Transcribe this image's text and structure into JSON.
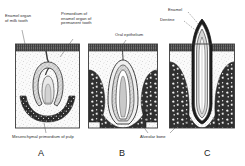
{
  "figure": {
    "background_color": "#ffffff",
    "ink_color": "#2b2b2b"
  },
  "labels": {
    "enamel_organ_milk": "Enamel organ\nof milk tooth",
    "primordium_permanent": "Primordium of\nenamel organ of\npermanent tooth",
    "oral_epithelium": "Oral epithelium",
    "mesenchymal_pulp": "Mesenchymal primordium of pulp",
    "alveolar_bone": "Alveolar bone",
    "enamel": "Enamel",
    "dentine": "Dentine"
  },
  "panels": [
    {
      "letter": "A",
      "caption": "Bud / cap stage"
    },
    {
      "letter": "B",
      "caption": "Bell stage"
    },
    {
      "letter": "C",
      "caption": "Erupting tooth"
    }
  ],
  "colors": {
    "epithelium": "#4a4a4a",
    "bone": "#2e2e2e",
    "enamel_dark": "#1f1f1f",
    "mesenchyme": "#f2f2f2",
    "border": "#3a3a3a"
  }
}
